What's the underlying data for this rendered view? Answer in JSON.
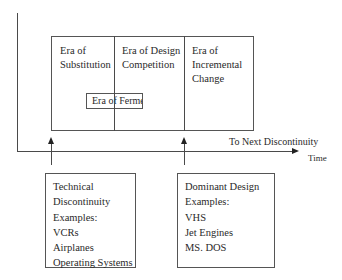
{
  "diagram": {
    "type": "technology-cycle",
    "eras": [
      {
        "label": "Era of Substitution",
        "lines": [
          "Era of",
          "Substitution"
        ]
      },
      {
        "label": "Era of Design Competition",
        "lines": [
          "Era of Design",
          "Competition"
        ]
      },
      {
        "label": "Era of Incremental Change",
        "lines": [
          "Era of",
          "Incremental",
          "Change"
        ]
      }
    ],
    "overlay_era": {
      "label": "Era of Fermen"
    },
    "axis": {
      "x_label": "Time",
      "arrow_label": "To Next Discontinuity"
    },
    "callouts": [
      {
        "name": "technical-discontinuity",
        "lines": [
          "Technical",
          "Discontinuity",
          "Examples:",
          "VCRs",
          "Airplanes",
          "Operating Systems"
        ]
      },
      {
        "name": "dominant-design",
        "lines": [
          "Dominant Design",
          "Examples:",
          "VHS",
          "Jet Engines",
          "MS. DOS"
        ]
      }
    ],
    "colors": {
      "line": "#4a4a4a",
      "arrow": "#222222",
      "text": "#2a2a2a",
      "background": "#ffffff"
    }
  }
}
